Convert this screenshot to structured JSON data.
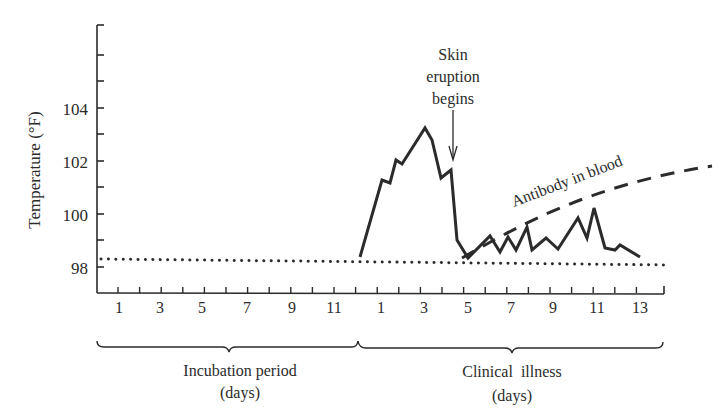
{
  "chart_data": {
    "type": "line",
    "title": "",
    "ylabel": "Temperature (°F)",
    "ylim": [
      97,
      107
    ],
    "yticks": [
      98,
      100,
      102,
      104
    ],
    "x_segments": [
      {
        "name": "Incubation period",
        "unit": "(days)",
        "ticks": [
          "1",
          "3",
          "5",
          "7",
          "9",
          "11"
        ],
        "day_range": [
          1,
          12
        ]
      },
      {
        "name": "Clinical illness",
        "unit": "(days)",
        "ticks": [
          "1",
          "3",
          "5",
          "7",
          "9",
          "11",
          "13"
        ],
        "day_range": [
          1,
          13
        ]
      }
    ],
    "series": [
      {
        "name": "Body temperature",
        "style": "solid",
        "points": [
          {
            "phase": "incubation",
            "day": 12.1,
            "temp": 98.4
          },
          {
            "phase": "clinical",
            "day": 1.0,
            "temp": 101.3
          },
          {
            "phase": "clinical",
            "day": 1.4,
            "temp": 101.2
          },
          {
            "phase": "clinical",
            "day": 1.7,
            "temp": 102.1
          },
          {
            "phase": "clinical",
            "day": 2.0,
            "temp": 101.9
          },
          {
            "phase": "clinical",
            "day": 3.0,
            "temp": 103.3
          },
          {
            "phase": "clinical",
            "day": 3.3,
            "temp": 102.8
          },
          {
            "phase": "clinical",
            "day": 3.8,
            "temp": 101.4
          },
          {
            "phase": "clinical",
            "day": 4.2,
            "temp": 101.7
          },
          {
            "phase": "clinical",
            "day": 4.5,
            "temp": 99.0
          },
          {
            "phase": "clinical",
            "day": 5.0,
            "temp": 98.4
          },
          {
            "phase": "clinical",
            "day": 6.0,
            "temp": 99.2
          },
          {
            "phase": "clinical",
            "day": 6.5,
            "temp": 98.6
          },
          {
            "phase": "clinical",
            "day": 6.8,
            "temp": 99.1
          },
          {
            "phase": "clinical",
            "day": 7.2,
            "temp": 98.7
          },
          {
            "phase": "clinical",
            "day": 7.7,
            "temp": 99.5
          },
          {
            "phase": "clinical",
            "day": 7.9,
            "temp": 98.7
          },
          {
            "phase": "clinical",
            "day": 8.6,
            "temp": 99.0
          },
          {
            "phase": "clinical",
            "day": 9.1,
            "temp": 98.7
          },
          {
            "phase": "clinical",
            "day": 10.0,
            "temp": 99.8
          },
          {
            "phase": "clinical",
            "day": 10.4,
            "temp": 99.1
          },
          {
            "phase": "clinical",
            "day": 10.8,
            "temp": 100.2
          },
          {
            "phase": "clinical",
            "day": 11.3,
            "temp": 98.8
          },
          {
            "phase": "clinical",
            "day": 11.8,
            "temp": 98.7
          },
          {
            "phase": "clinical",
            "day": 12.0,
            "temp": 98.8
          },
          {
            "phase": "clinical",
            "day": 13.0,
            "temp": 98.4
          }
        ]
      },
      {
        "name": "Antibody in blood",
        "style": "dashed",
        "description": "Rises from ~clinical day 5 and increases steadily beyond day 13"
      },
      {
        "name": "Normal temperature",
        "style": "dotted",
        "value": 98.4
      }
    ],
    "annotations": [
      {
        "text": "Skin eruption begins",
        "type": "arrow",
        "at": {
          "phase": "clinical",
          "day": 4.2
        }
      },
      {
        "text": "Antibody in blood",
        "type": "label",
        "along": "dashed curve"
      }
    ]
  },
  "labels": {
    "y_axis": "Temperature (°F)",
    "y_ticks": [
      "104",
      "102",
      "100",
      "98"
    ],
    "incubation_ticks": [
      "1",
      "3",
      "5",
      "7",
      "9",
      "11"
    ],
    "clinical_ticks": [
      "1",
      "3",
      "5",
      "7",
      "9",
      "11",
      "13"
    ],
    "skin_eruption": [
      "Skin",
      "eruption",
      "begins"
    ],
    "antibody": "Antibody in blood",
    "incubation_title": "Incubation period",
    "incubation_unit": "(days)",
    "clinical_title": "Clinical  illness",
    "clinical_unit": "(days)"
  }
}
